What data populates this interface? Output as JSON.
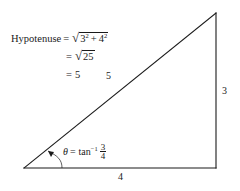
{
  "figure": {
    "background_color": "#ffffff",
    "stroke_color": "#1a1a1a"
  },
  "formula": {
    "label": "Hypotenuse",
    "equals": "=",
    "line1": {
      "radical_sign": "√",
      "base1": "3",
      "exp1": "2",
      "plus": "+",
      "base2": "4",
      "exp2": "2"
    },
    "line2": {
      "radical_sign": "√",
      "radicand": "25"
    },
    "line3": {
      "value": "5"
    }
  },
  "angle": {
    "symbol": "θ",
    "equals": "=",
    "function": "tan",
    "inverse_exponent": "−1",
    "numerator": "3",
    "denominator": "4"
  },
  "side_labels": {
    "opposite": "3",
    "adjacent": "4",
    "hypotenuse": "5"
  },
  "geometry": {
    "vertex_left": "24,168",
    "vertex_bottom_right": "216,168",
    "vertex_top": "216,13"
  }
}
